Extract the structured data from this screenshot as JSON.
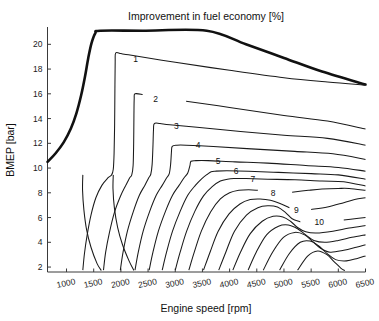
{
  "chart_data": {
    "type": "line",
    "title": "Improvement in fuel economy [%]",
    "xlabel": "Engine speed [rpm]",
    "ylabel": "BMEP [bar]",
    "xlim": [
      650,
      6500
    ],
    "ylim": [
      1.6,
      21.4
    ],
    "xticks": [
      1000,
      1500,
      2000,
      2500,
      3000,
      3500,
      4000,
      4500,
      5000,
      5500,
      6000,
      6500
    ],
    "yticks": [
      2,
      4,
      6,
      8,
      10,
      12,
      14,
      16,
      18,
      20
    ],
    "grid": false,
    "legend": "none",
    "series": [
      {
        "name": "full-load-envelope",
        "label": "",
        "style": "thick",
        "points": [
          [
            650,
            10.5
          ],
          [
            800,
            11.2
          ],
          [
            950,
            12.1
          ],
          [
            1080,
            13.2
          ],
          [
            1180,
            14.4
          ],
          [
            1270,
            15.9
          ],
          [
            1340,
            17.4
          ],
          [
            1400,
            18.9
          ],
          [
            1460,
            20.1
          ],
          [
            1530,
            20.9
          ],
          [
            1620,
            21.1
          ],
          [
            2400,
            21.1
          ],
          [
            3580,
            21.1
          ],
          [
            4300,
            20.0
          ],
          [
            5000,
            18.9
          ],
          [
            5700,
            17.8
          ],
          [
            6500,
            16.75
          ]
        ]
      },
      {
        "name": "contour-1",
        "label": "1",
        "value": 1,
        "label_x": 2270,
        "label_y": 18.85,
        "points": [
          [
            1300,
            1.75
          ],
          [
            1330,
            3.1
          ],
          [
            1380,
            4.6
          ],
          [
            1450,
            6.2
          ],
          [
            1540,
            7.6
          ],
          [
            1650,
            8.6
          ],
          [
            1760,
            9.2
          ],
          [
            1830,
            9.45
          ],
          [
            1860,
            9.9
          ],
          [
            1875,
            11.2
          ],
          [
            1885,
            13.6
          ],
          [
            1890,
            16.4
          ],
          [
            1895,
            18.6
          ],
          [
            1905,
            19.3
          ],
          [
            2000,
            19.25
          ],
          [
            2140,
            19.15
          ],
          [
            3000,
            18.55
          ],
          [
            4000,
            17.9
          ],
          [
            5000,
            17.3
          ],
          [
            5800,
            16.95
          ],
          [
            6500,
            16.7
          ]
        ]
      },
      {
        "name": "contour-2",
        "label": "2",
        "value": 2,
        "label_x": 2640,
        "label_y": 15.6,
        "points": [
          [
            1680,
            1.75
          ],
          [
            1720,
            3.2
          ],
          [
            1790,
            4.8
          ],
          [
            1880,
            6.4
          ],
          [
            1990,
            7.7
          ],
          [
            2090,
            8.6
          ],
          [
            2160,
            9.2
          ],
          [
            2200,
            9.45
          ],
          [
            2225,
            10.2
          ],
          [
            2235,
            12.0
          ],
          [
            2240,
            14.2
          ],
          [
            2245,
            15.6
          ],
          [
            2260,
            16.0
          ],
          [
            2400,
            15.95
          ],
          [
            2600,
            15.8
          ],
          [
            3200,
            15.4
          ],
          [
            4000,
            14.9
          ],
          [
            5000,
            14.25
          ],
          [
            5800,
            13.8
          ],
          [
            6500,
            13.15
          ]
        ]
      },
      {
        "name": "contour-3",
        "label": "3",
        "value": 3,
        "label_x": 3020,
        "label_y": 13.4,
        "points": [
          [
            1990,
            1.75
          ],
          [
            2040,
            3.2
          ],
          [
            2120,
            4.9
          ],
          [
            2230,
            6.5
          ],
          [
            2340,
            7.8
          ],
          [
            2440,
            8.6
          ],
          [
            2510,
            9.2
          ],
          [
            2550,
            9.5
          ],
          [
            2575,
            10.3
          ],
          [
            2590,
            11.8
          ],
          [
            2600,
            13.1
          ],
          [
            2615,
            13.6
          ],
          [
            2720,
            13.6
          ],
          [
            2900,
            13.5
          ],
          [
            3400,
            13.3
          ],
          [
            4200,
            12.95
          ],
          [
            5000,
            12.65
          ],
          [
            5800,
            12.4
          ],
          [
            6500,
            11.85
          ]
        ]
      },
      {
        "name": "contour-4",
        "label": "4",
        "value": 4,
        "label_x": 3420,
        "label_y": 11.85,
        "points": [
          [
            2260,
            1.75
          ],
          [
            2320,
            3.2
          ],
          [
            2410,
            4.9
          ],
          [
            2530,
            6.5
          ],
          [
            2650,
            7.8
          ],
          [
            2760,
            8.6
          ],
          [
            2840,
            9.2
          ],
          [
            2890,
            9.55
          ],
          [
            2915,
            10.3
          ],
          [
            2930,
            11.3
          ],
          [
            2945,
            11.75
          ],
          [
            3030,
            11.85
          ],
          [
            3200,
            11.85
          ],
          [
            3700,
            11.75
          ],
          [
            4400,
            11.55
          ],
          [
            5200,
            11.35
          ],
          [
            5900,
            11.15
          ],
          [
            6500,
            10.7
          ]
        ]
      },
      {
        "name": "contour-5",
        "label": "5",
        "value": 5,
        "label_x": 3790,
        "label_y": 10.6,
        "points": [
          [
            2520,
            1.75
          ],
          [
            2590,
            3.2
          ],
          [
            2690,
            4.9
          ],
          [
            2820,
            6.5
          ],
          [
            2950,
            7.8
          ],
          [
            3070,
            8.6
          ],
          [
            3160,
            9.2
          ],
          [
            3230,
            9.6
          ],
          [
            3270,
            10.2
          ],
          [
            3290,
            10.55
          ],
          [
            3380,
            10.6
          ],
          [
            3600,
            10.6
          ],
          [
            4100,
            10.5
          ],
          [
            4700,
            10.4
          ],
          [
            5400,
            10.2
          ],
          [
            6000,
            10.05
          ],
          [
            6500,
            9.75
          ]
        ]
      },
      {
        "name": "contour-6",
        "label": "6",
        "value": 6,
        "label_x": 4120,
        "label_y": 9.75,
        "points": [
          [
            2760,
            1.75
          ],
          [
            2840,
            3.2
          ],
          [
            2950,
            4.9
          ],
          [
            3090,
            6.5
          ],
          [
            3230,
            7.8
          ],
          [
            3370,
            8.6
          ],
          [
            3490,
            9.15
          ],
          [
            3590,
            9.5
          ],
          [
            3660,
            9.7
          ],
          [
            3740,
            9.75
          ],
          [
            3950,
            9.78
          ],
          [
            4350,
            9.75
          ],
          [
            4900,
            9.65
          ],
          [
            5500,
            9.55
          ],
          [
            6000,
            9.45
          ],
          [
            6500,
            9.1
          ]
        ]
      },
      {
        "name": "contour-7",
        "label": "7",
        "value": 7,
        "label_x": 4430,
        "label_y": 9.1,
        "points": [
          [
            3000,
            1.75
          ],
          [
            3090,
            3.2
          ],
          [
            3210,
            4.9
          ],
          [
            3360,
            6.5
          ],
          [
            3520,
            7.75
          ],
          [
            3680,
            8.5
          ],
          [
            3830,
            8.95
          ],
          [
            3960,
            9.1
          ],
          [
            4080,
            9.15
          ],
          [
            4300,
            9.15
          ],
          [
            4700,
            9.1
          ],
          [
            5200,
            9.05
          ],
          [
            5700,
            8.95
          ],
          [
            6100,
            8.9
          ],
          [
            6500,
            8.55
          ]
        ]
      },
      {
        "name": "contour-8",
        "label": "8",
        "value": 8,
        "label_x": 4800,
        "label_y": 8.0,
        "points": [
          [
            3250,
            1.75
          ],
          [
            3350,
            3.2
          ],
          [
            3480,
            4.9
          ],
          [
            3650,
            6.45
          ],
          [
            3830,
            7.5
          ],
          [
            4000,
            8.0
          ],
          [
            4170,
            8.2
          ],
          [
            4350,
            8.25
          ],
          [
            4520,
            8.2
          ],
          [
            4700,
            8.05
          ],
          [
            4900,
            8.0
          ],
          [
            5150,
            8.05
          ],
          [
            5450,
            8.2
          ],
          [
            5700,
            8.3
          ],
          [
            6000,
            8.35
          ],
          [
            6200,
            8.35
          ],
          [
            6500,
            8.2
          ]
        ]
      },
      {
        "name": "contour-9",
        "label": "9",
        "value": 9,
        "label_x": 5230,
        "label_y": 6.65,
        "points": [
          [
            3520,
            1.75
          ],
          [
            3640,
            3.2
          ],
          [
            3790,
            4.9
          ],
          [
            3990,
            6.3
          ],
          [
            4190,
            7.1
          ],
          [
            4380,
            7.45
          ],
          [
            4560,
            7.5
          ],
          [
            4750,
            7.4
          ],
          [
            4950,
            7.1
          ],
          [
            5100,
            6.8
          ],
          [
            5300,
            6.65
          ],
          [
            5500,
            6.65
          ],
          [
            5800,
            6.85
          ],
          [
            6100,
            7.2
          ],
          [
            6300,
            7.45
          ],
          [
            6500,
            7.6
          ]
        ]
      },
      {
        "name": "contour-10",
        "label": "10",
        "value": 10,
        "label_x": 5650,
        "label_y": 5.65,
        "points": [
          [
            3800,
            1.75
          ],
          [
            3930,
            3.2
          ],
          [
            4090,
            4.9
          ],
          [
            4310,
            6.2
          ],
          [
            4520,
            6.8
          ],
          [
            4700,
            6.95
          ],
          [
            4880,
            6.85
          ],
          [
            5030,
            6.4
          ],
          [
            5150,
            5.9
          ],
          [
            5300,
            5.65
          ],
          [
            5500,
            5.6
          ],
          [
            5800,
            5.65
          ],
          [
            6100,
            5.8
          ],
          [
            6300,
            5.9
          ],
          [
            6500,
            6.0
          ]
        ]
      },
      {
        "name": "inner-tail-a",
        "label": "",
        "points": [
          [
            4060,
            1.75
          ],
          [
            4200,
            3.2
          ],
          [
            4380,
            4.7
          ],
          [
            4600,
            5.7
          ],
          [
            4800,
            6.1
          ],
          [
            4980,
            6.05
          ],
          [
            5120,
            5.7
          ],
          [
            5250,
            5.2
          ],
          [
            5400,
            4.85
          ],
          [
            5600,
            4.75
          ],
          [
            5900,
            4.9
          ],
          [
            6200,
            5.15
          ],
          [
            6500,
            5.35
          ]
        ]
      },
      {
        "name": "inner-tail-b",
        "label": "",
        "points": [
          [
            4340,
            1.75
          ],
          [
            4490,
            3.2
          ],
          [
            4680,
            4.6
          ],
          [
            4900,
            5.3
          ],
          [
            5080,
            5.4
          ],
          [
            5250,
            5.1
          ],
          [
            5400,
            4.6
          ],
          [
            5550,
            4.15
          ],
          [
            5750,
            4.0
          ],
          [
            6000,
            4.15
          ],
          [
            6250,
            4.4
          ],
          [
            6500,
            4.6
          ]
        ]
      },
      {
        "name": "inner-tail-c",
        "label": "",
        "points": [
          [
            4620,
            1.75
          ],
          [
            4790,
            3.2
          ],
          [
            4990,
            4.4
          ],
          [
            5200,
            4.8
          ],
          [
            5380,
            4.6
          ],
          [
            5520,
            4.1
          ],
          [
            5680,
            3.5
          ],
          [
            5850,
            3.2
          ],
          [
            6100,
            3.35
          ],
          [
            6330,
            3.6
          ],
          [
            6500,
            3.8
          ]
        ]
      },
      {
        "name": "inner-tail-d",
        "label": "",
        "points": [
          [
            4920,
            1.75
          ],
          [
            5100,
            3.1
          ],
          [
            5300,
            4.0
          ],
          [
            5480,
            4.1
          ],
          [
            5640,
            3.7
          ],
          [
            5790,
            3.1
          ],
          [
            5950,
            2.6
          ],
          [
            6150,
            2.5
          ],
          [
            6350,
            2.7
          ],
          [
            6500,
            2.9
          ]
        ]
      },
      {
        "name": "inner-tail-e",
        "label": "",
        "points": [
          [
            5250,
            1.75
          ],
          [
            5440,
            2.9
          ],
          [
            5620,
            3.3
          ],
          [
            5790,
            3.0
          ],
          [
            5930,
            2.4
          ],
          [
            6050,
            1.9
          ],
          [
            6120,
            1.72
          ]
        ]
      },
      {
        "name": "lower-left-tail-1",
        "label": "",
        "points": [
          [
            1300,
            9.45
          ],
          [
            1295,
            8.2
          ],
          [
            1320,
            6.6
          ],
          [
            1370,
            5.0
          ],
          [
            1450,
            3.6
          ],
          [
            1560,
            2.3
          ],
          [
            1640,
            1.72
          ]
        ]
      },
      {
        "name": "lower-left-tail-2",
        "label": "",
        "points": [
          [
            1860,
            9.45
          ],
          [
            1855,
            8.3
          ],
          [
            1880,
            6.8
          ],
          [
            1940,
            5.2
          ],
          [
            2030,
            3.8
          ],
          [
            2150,
            2.5
          ],
          [
            2240,
            1.72
          ]
        ]
      }
    ]
  },
  "axes": {
    "xticklabels": [
      "1000",
      "1500",
      "2000",
      "2500",
      "3000",
      "3500",
      "4000",
      "4500",
      "5000",
      "5500",
      "6000",
      "6500"
    ],
    "yticklabels": [
      "2",
      "4",
      "6",
      "8",
      "10",
      "12",
      "14",
      "16",
      "18",
      "20"
    ]
  }
}
